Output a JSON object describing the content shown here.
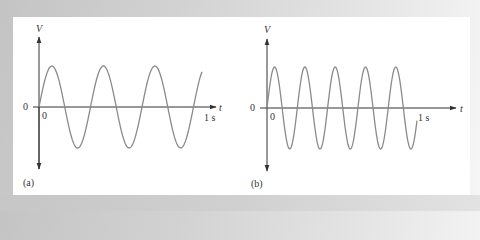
{
  "figure": {
    "panels": [
      {
        "id": "a",
        "caption": "(a)",
        "y_axis_label": "V",
        "x_axis_label": "t",
        "y_origin_label": "0",
        "x_origin_label": "0",
        "x_end_label": "1 s",
        "cycles_per_second": 3
      },
      {
        "id": "b",
        "caption": "(b)",
        "y_axis_label": "V",
        "x_axis_label": "t",
        "y_origin_label": "0",
        "x_origin_label": "0",
        "x_end_label": "1 s",
        "cycles_per_second": 5
      }
    ],
    "colors": {
      "axis": "#333333",
      "curve": "#8a8a8a",
      "panel": "#ffffff"
    }
  },
  "chart_data": [
    {
      "type": "line",
      "title": "(a)",
      "xlabel": "t",
      "ylabel": "V",
      "x_range": [
        0,
        1
      ],
      "x_ticks": [
        "0",
        "1 s"
      ],
      "y_ticks": [
        "0"
      ],
      "series": [
        {
          "name": "sinusoid",
          "function": "sin(2*pi*3*t)",
          "frequency_hz": 3,
          "amplitude": 1
        }
      ],
      "grid": false
    },
    {
      "type": "line",
      "title": "(b)",
      "xlabel": "t",
      "ylabel": "V",
      "x_range": [
        0,
        1
      ],
      "x_ticks": [
        "0",
        "1 s"
      ],
      "y_ticks": [
        "0"
      ],
      "series": [
        {
          "name": "sinusoid",
          "function": "sin(2*pi*5*t)",
          "frequency_hz": 5,
          "amplitude": 1
        }
      ],
      "grid": false
    }
  ]
}
